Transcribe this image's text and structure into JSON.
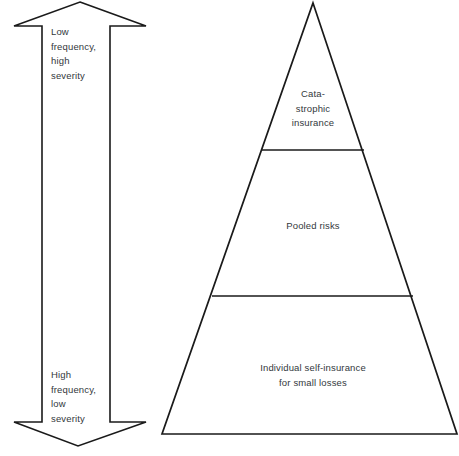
{
  "figure": {
    "width": 459,
    "height": 456,
    "background_color": "#ffffff",
    "stroke_color": "#1a1a1a",
    "text_color": "#33383c"
  },
  "arrow": {
    "name": "double-headed-vertical-arrow",
    "direction": "up-and-down",
    "top_label": "Low\nfrequency,\nhigh\nseverity",
    "bottom_label": "High\nfrequency,\nlow\nseverity",
    "geometry": {
      "tip_top_x": 80,
      "tip_top_y": 2,
      "tip_bottom_x": 78,
      "tip_bottom_y": 446,
      "head_left_x": 14,
      "head_right_x": 146,
      "head_top_y": 26,
      "head_bottom_y": 422,
      "shaft_left_x": 42,
      "shaft_right_x": 110
    }
  },
  "pyramid": {
    "name": "risk-financing-pyramid",
    "apex": {
      "x": 313,
      "y": 3
    },
    "base_left": {
      "x": 162,
      "y": 434
    },
    "base_right": {
      "x": 457,
      "y": 434
    },
    "dividers": [
      {
        "y": 150,
        "x_left": 261,
        "x_right": 364
      },
      {
        "y": 296,
        "x_left": 212,
        "x_right": 413
      }
    ],
    "tiers": [
      {
        "name": "catastrophic-insurance",
        "label": "Cata-\nstrophic\ninsurance"
      },
      {
        "name": "pooled-risks",
        "label": "Pooled risks"
      },
      {
        "name": "individual-self-insurance",
        "label": "Individual self-insurance\nfor small losses"
      }
    ]
  }
}
